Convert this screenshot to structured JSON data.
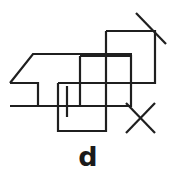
{
  "figure": {
    "label": "d",
    "stroke_color": "#1f1f1f",
    "background_color": "#ffffff",
    "stroke_width": 2.2,
    "shapes": [
      {
        "name": "trapezoid-arrow-left",
        "type": "polyline",
        "points": "10,83 33,54 132,54"
      },
      {
        "name": "trapezoid-base-left",
        "type": "polyline",
        "points": "10,83 38,83 38,106"
      },
      {
        "name": "baseline-horizontal",
        "type": "line",
        "points": "10,106 131,106"
      },
      {
        "name": "middle-rectangle",
        "type": "rect",
        "points": "80,56 131,56 131,106 80,106 80,56"
      },
      {
        "name": "right-rectangle",
        "type": "rect",
        "points": "106,31 155,31 155,83 106,83 106,31"
      },
      {
        "name": "lower-left-rectangle",
        "type": "rect",
        "points": "58,83 106,83 106,131 58,131 58,83"
      },
      {
        "name": "short-vertical-tick",
        "type": "line",
        "points": "67,86 67,117"
      },
      {
        "name": "diagonal-slash-top-right",
        "type": "line",
        "points": "136,13 166,44"
      },
      {
        "name": "x-mark-stroke-a",
        "type": "line",
        "points": "126,103 155,133"
      },
      {
        "name": "x-mark-stroke-b",
        "type": "line",
        "points": "155,103 126,133"
      }
    ]
  }
}
